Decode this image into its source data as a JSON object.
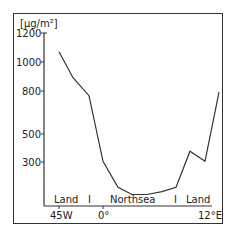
{
  "chart_data": {
    "type": "line",
    "title": "",
    "ylabel": "[µg/m²]",
    "xlabel": "",
    "ylim": [
      0,
      1200
    ],
    "yticks": [
      300,
      500,
      800,
      1000,
      1200
    ],
    "xticks": [
      "45W",
      "0°",
      "12°E"
    ],
    "region_labels": [
      "Land",
      "I",
      "Northsea",
      "I",
      "Land"
    ],
    "grid": false,
    "legend": null,
    "series": [
      {
        "name": "deposition",
        "points": [
          {
            "x": 59,
            "y": 1070
          },
          {
            "x": 73,
            "y": 890
          },
          {
            "x": 89,
            "y": 765
          },
          {
            "x": 103,
            "y": 310
          },
          {
            "x": 118,
            "y": 130
          },
          {
            "x": 132,
            "y": 80
          },
          {
            "x": 147,
            "y": 80
          },
          {
            "x": 162,
            "y": 100
          },
          {
            "x": 176,
            "y": 130
          },
          {
            "x": 190,
            "y": 380
          },
          {
            "x": 205,
            "y": 310
          },
          {
            "x": 219,
            "y": 790
          }
        ]
      }
    ]
  },
  "labels": {
    "unit": "[µg/m²]",
    "y1200": "1200",
    "y1000": "1000",
    "y800": "800",
    "y500": "500",
    "y300": "300",
    "land_left": "Land",
    "sep_left": "I",
    "sea": "Northsea",
    "sep_right": "I",
    "land_right": "Land",
    "x_45w": "45W",
    "x_0": "0°",
    "x_12e": "12°E"
  }
}
